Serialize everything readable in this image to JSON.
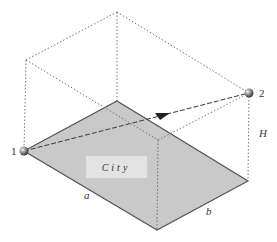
{
  "diagram": {
    "type": "isometric-geometry",
    "colors": {
      "plane_fill": "#c9c9c9",
      "plane_edge": "#555555",
      "dotted": "#666666",
      "city_box": "#e6e6e6",
      "point": "#777777"
    },
    "labels": {
      "point1": "1",
      "point2": "2",
      "city": "City",
      "a": "a",
      "b": "b",
      "H": "H"
    }
  }
}
